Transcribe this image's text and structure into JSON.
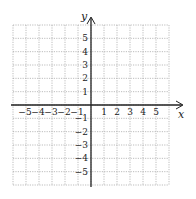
{
  "chart_data": {
    "type": "coordinate-grid",
    "title": "",
    "xlabel": "x",
    "ylabel": "y",
    "xlim": [
      -6,
      6
    ],
    "ylim": [
      -6,
      6
    ],
    "grid": true,
    "grid_style": "dotted",
    "x_ticks": [
      "-5",
      "-4",
      "-3",
      "-2",
      "-1",
      "1",
      "2",
      "3",
      "4",
      "5"
    ],
    "y_ticks": [
      "5",
      "4",
      "3",
      "2",
      "1",
      "-1",
      "-2",
      "-3",
      "-4",
      "-5"
    ],
    "series": []
  },
  "axes": {
    "x_label": "x",
    "y_label": "y"
  },
  "colors": {
    "axis": "#222222",
    "grid": "#9a9a9a",
    "background": "#ffffff"
  }
}
